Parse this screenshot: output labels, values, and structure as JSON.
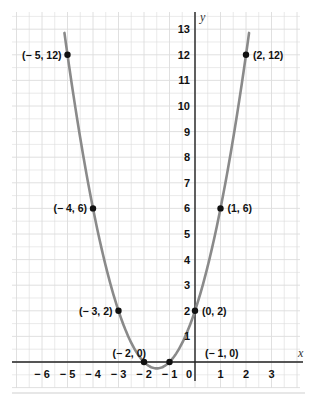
{
  "chart_data": {
    "type": "line",
    "title": "",
    "equation": "y = x^2 + 3x + 2",
    "xlabel": "x",
    "ylabel": "y",
    "xlim": [
      -7,
      4
    ],
    "ylim": [
      -1,
      13.5
    ],
    "grid": true,
    "x_ticks": [
      "-6",
      "-5",
      "-4",
      "-3",
      "-2",
      "-1",
      "0",
      "1",
      "2",
      "3"
    ],
    "y_ticks": [
      "1",
      "2",
      "3",
      "4",
      "5",
      "6",
      "7",
      "8",
      "9",
      "10",
      "11",
      "12",
      "13"
    ],
    "series": [
      {
        "name": "parabola",
        "color": "#8a8a8a",
        "x": [
          -5,
          -4,
          -3,
          -2,
          -1.5,
          -1,
          0,
          1,
          2
        ],
        "y": [
          12,
          6,
          2,
          0,
          -0.25,
          0,
          2,
          6,
          12
        ]
      }
    ],
    "points": [
      {
        "x": -5,
        "y": 12,
        "label": "(−5, 12)",
        "side": "left"
      },
      {
        "x": 2,
        "y": 12,
        "label": "(2, 12)",
        "side": "right"
      },
      {
        "x": -4,
        "y": 6,
        "label": "(−4, 6)",
        "side": "left"
      },
      {
        "x": 1,
        "y": 6,
        "label": "(1, 6)",
        "side": "right"
      },
      {
        "x": -3,
        "y": 2,
        "label": "(−3, 2)",
        "side": "left"
      },
      {
        "x": 0,
        "y": 2,
        "label": "(0, 2)",
        "side": "right"
      },
      {
        "x": -2,
        "y": 0,
        "label": "(−2, 0)",
        "side": "above-left"
      },
      {
        "x": -1,
        "y": 0,
        "label": "(−1, 0)",
        "side": "above-right"
      }
    ],
    "colors": {
      "grid": "#dcdcdc",
      "axis": "#222222",
      "curve": "#8a8a8a",
      "point": "#111111"
    }
  }
}
